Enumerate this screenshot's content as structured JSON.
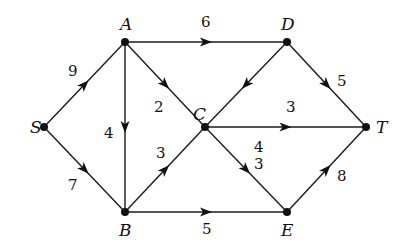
{
  "diagram": {
    "type": "directed-weighted-graph",
    "nodes": [
      {
        "id": "S",
        "label": "S",
        "x": 44,
        "y": 127,
        "lx": 30,
        "ly": 133
      },
      {
        "id": "A",
        "label": "A",
        "x": 125,
        "y": 42,
        "lx": 120,
        "ly": 30
      },
      {
        "id": "B",
        "label": "B",
        "x": 125,
        "y": 212,
        "lx": 119,
        "ly": 236
      },
      {
        "id": "C",
        "label": "C",
        "x": 205,
        "y": 127,
        "lx": 193,
        "ly": 120
      },
      {
        "id": "D",
        "label": "D",
        "x": 287,
        "y": 42,
        "lx": 281,
        "ly": 30
      },
      {
        "id": "E",
        "label": "E",
        "x": 287,
        "y": 212,
        "lx": 281,
        "ly": 236
      },
      {
        "id": "T",
        "label": "T",
        "x": 366,
        "y": 127,
        "lx": 376,
        "ly": 133
      }
    ],
    "edges": [
      {
        "from": "S",
        "to": "A",
        "weight": "9",
        "wx": 68,
        "wy": 76
      },
      {
        "from": "S",
        "to": "B",
        "weight": "7",
        "wx": 68,
        "wy": 190
      },
      {
        "from": "A",
        "to": "D",
        "weight": "6",
        "wx": 201,
        "wy": 27
      },
      {
        "from": "A",
        "to": "B",
        "weight": "4",
        "wx": 104,
        "wy": 138
      },
      {
        "from": "A",
        "to": "C",
        "weight": "2",
        "wx": 154,
        "wy": 112
      },
      {
        "from": "B",
        "to": "C",
        "weight": "3",
        "wx": 156,
        "wy": 158
      },
      {
        "from": "B",
        "to": "E",
        "weight": "5",
        "wx": 202,
        "wy": 234
      },
      {
        "from": "D",
        "to": "C",
        "weight": "4",
        "wx": 254,
        "wy": 152
      },
      {
        "from": "D",
        "to": "T",
        "weight": "5",
        "wx": 337,
        "wy": 86
      },
      {
        "from": "C",
        "to": "T",
        "weight": "3",
        "wx": 286,
        "wy": 112
      },
      {
        "from": "C",
        "to": "E",
        "weight": "3",
        "wx": 254,
        "wy": 169
      },
      {
        "from": "E",
        "to": "T",
        "weight": "8",
        "wx": 337,
        "wy": 181
      }
    ]
  }
}
